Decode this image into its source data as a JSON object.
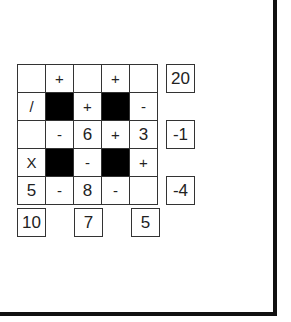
{
  "puzzle": {
    "grid": [
      [
        {
          "v": "",
          "t": "num"
        },
        {
          "v": "+",
          "t": "op"
        },
        {
          "v": "",
          "t": "num"
        },
        {
          "v": "+",
          "t": "op"
        },
        {
          "v": "",
          "t": "num"
        }
      ],
      [
        {
          "v": "/",
          "t": "op"
        },
        {
          "v": "",
          "t": "black"
        },
        {
          "v": "+",
          "t": "op"
        },
        {
          "v": "",
          "t": "black"
        },
        {
          "v": "-",
          "t": "op"
        }
      ],
      [
        {
          "v": "",
          "t": "num"
        },
        {
          "v": "-",
          "t": "op"
        },
        {
          "v": "6",
          "t": "num"
        },
        {
          "v": "+",
          "t": "op"
        },
        {
          "v": "3",
          "t": "num"
        }
      ],
      [
        {
          "v": "X",
          "t": "op"
        },
        {
          "v": "",
          "t": "black"
        },
        {
          "v": "-",
          "t": "op"
        },
        {
          "v": "",
          "t": "black"
        },
        {
          "v": "+",
          "t": "op"
        }
      ],
      [
        {
          "v": "5",
          "t": "num"
        },
        {
          "v": "-",
          "t": "op"
        },
        {
          "v": "8",
          "t": "num"
        },
        {
          "v": "-",
          "t": "op"
        },
        {
          "v": "",
          "t": "num"
        }
      ]
    ],
    "row_results": [
      {
        "row": 0,
        "value": "20"
      },
      {
        "row": 2,
        "value": "-1"
      },
      {
        "row": 4,
        "value": "-4"
      }
    ],
    "col_results": [
      {
        "col": 0,
        "value": "10"
      },
      {
        "col": 2,
        "value": "7"
      },
      {
        "col": 4,
        "value": "5"
      }
    ]
  }
}
